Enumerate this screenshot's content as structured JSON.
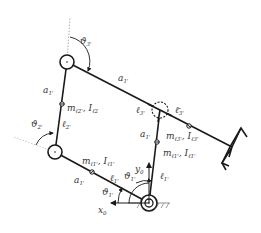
{
  "diagram": {
    "type": "planar closed-chain manipulator kinematic sketch",
    "colors": {
      "link": "#1a1a1a",
      "label": "#333333",
      "guide": "#999999",
      "background": "#ffffff"
    },
    "labels": {
      "theta3": {
        "base": "ϑ",
        "sub": "3'"
      },
      "a1_top_link": {
        "base": "a",
        "sub": "1'"
      },
      "a1_left_upper": {
        "base": "a",
        "sub": "1'"
      },
      "m2_l2": {
        "base": "m",
        "sub": "ℓ2'",
        "text2": ", I",
        "sub2": "ℓ2"
      },
      "l2": {
        "base": "ℓ",
        "sub": "2'"
      },
      "theta2": {
        "base": "ϑ",
        "sub": "2'"
      },
      "l3": {
        "base": "ℓ",
        "sub": "3'"
      },
      "l3bar": {
        "base": "ℓ̄",
        "sub": "3'"
      },
      "a1_right": {
        "base": "a",
        "sub": "1'"
      },
      "m3_I3": {
        "base": "m",
        "sub": "ℓ3'",
        "text2": ", I",
        "sub2": "ℓ3'"
      },
      "m1_I1_right": {
        "base": "m",
        "sub": "ℓ1'",
        "text2": ", I",
        "sub2": "ℓ1'"
      },
      "m1_I1_lower": {
        "base": "m",
        "sub": "ℓ1'",
        "text2": ", I",
        "sub2": "ℓ1'"
      },
      "a1_lower": {
        "base": "a",
        "sub": "1'"
      },
      "l1_lower": {
        "base": "ℓ",
        "sub": "1'"
      },
      "theta1_lower_a": {
        "base": "ϑ",
        "sub": "1'"
      },
      "theta1_lower_b": {
        "base": "ϑ",
        "sub": "1'"
      },
      "y0": {
        "base": "y",
        "sub": "0"
      },
      "x0": {
        "base": "x",
        "sub": "0"
      },
      "l1_right": {
        "base": "ℓ",
        "sub": "1'"
      }
    },
    "joints": [
      {
        "id": "joint-top-left",
        "style": "solid"
      },
      {
        "id": "joint-left-middle",
        "style": "solid"
      },
      {
        "id": "joint-right-passive",
        "style": "dashed"
      },
      {
        "id": "joint-base",
        "style": "double-ground"
      }
    ]
  }
}
